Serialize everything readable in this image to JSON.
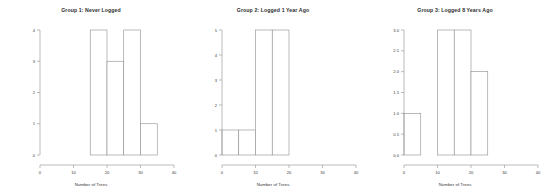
{
  "figure": {
    "background": "#ffffff",
    "line_color": "#8d8d8d",
    "text_color": "#3a3a3a"
  },
  "chart_data": [
    {
      "type": "bar",
      "title": "Group 1: Never Logged",
      "xlabel": "Number of Trees",
      "ylabel": "",
      "xlim": [
        0,
        40
      ],
      "ylim": [
        0,
        4
      ],
      "xticks": [
        "0",
        "10",
        "20",
        "30",
        "40"
      ],
      "xtick_values": [
        0,
        10,
        20,
        30,
        40
      ],
      "yticks": [
        "0",
        "1",
        "2",
        "3",
        "4"
      ],
      "ytick_values": [
        0,
        1,
        2,
        3,
        4
      ],
      "grid": false,
      "legend": "none",
      "bin_width": 5,
      "bins": [
        {
          "x0": 15,
          "x1": 20,
          "count": 4
        },
        {
          "x0": 20,
          "x1": 25,
          "count": 3
        },
        {
          "x0": 25,
          "x1": 30,
          "count": 4
        },
        {
          "x0": 30,
          "x1": 35,
          "count": 1
        }
      ]
    },
    {
      "type": "bar",
      "title": "Group 2: Logged 1 Year Ago",
      "xlabel": "Number of Trees",
      "ylabel": "",
      "xlim": [
        0,
        40
      ],
      "ylim": [
        0,
        5
      ],
      "xticks": [
        "0",
        "10",
        "20",
        "30",
        "40"
      ],
      "xtick_values": [
        0,
        10,
        20,
        30,
        40
      ],
      "yticks": [
        "0",
        "1",
        "2",
        "3",
        "4",
        "5"
      ],
      "ytick_values": [
        0,
        1,
        2,
        3,
        4,
        5
      ],
      "grid": false,
      "legend": "none",
      "bin_width": 5,
      "bins": [
        {
          "x0": 0,
          "x1": 5,
          "count": 1
        },
        {
          "x0": 5,
          "x1": 10,
          "count": 1
        },
        {
          "x0": 10,
          "x1": 15,
          "count": 5
        },
        {
          "x0": 15,
          "x1": 20,
          "count": 5
        }
      ]
    },
    {
      "type": "bar",
      "title": "Group 3: Logged 8 Years Ago",
      "xlabel": "Number of Trees",
      "ylabel": "",
      "xlim": [
        0,
        40
      ],
      "ylim": [
        0,
        3
      ],
      "xticks": [
        "0",
        "10",
        "20",
        "30",
        "40"
      ],
      "xtick_values": [
        0,
        10,
        20,
        30,
        40
      ],
      "yticks": [
        "0.0",
        "0.5",
        "1.0",
        "1.5",
        "2.0",
        "2.5",
        "3.0"
      ],
      "ytick_values": [
        0,
        0.5,
        1,
        1.5,
        2,
        2.5,
        3
      ],
      "grid": false,
      "legend": "none",
      "bin_width": 5,
      "bins": [
        {
          "x0": 0,
          "x1": 5,
          "count": 1
        },
        {
          "x0": 10,
          "x1": 15,
          "count": 3
        },
        {
          "x0": 15,
          "x1": 20,
          "count": 3
        },
        {
          "x0": 20,
          "x1": 25,
          "count": 2
        }
      ]
    }
  ]
}
